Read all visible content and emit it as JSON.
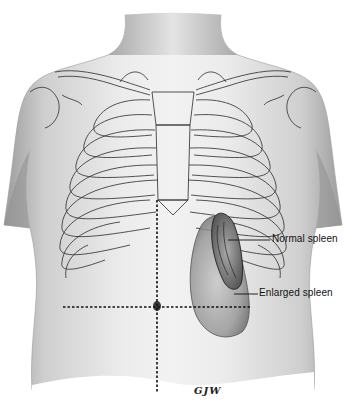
{
  "figure": {
    "labels": {
      "normal_spleen": "Normal spleen",
      "enlarged_spleen": "Enlarged spleen"
    },
    "signature": "GJW",
    "colors": {
      "background": "#ffffff",
      "skin_light": "#e6e6e6",
      "skin_mid": "#bdbdbd",
      "skin_dark": "#8a8a8a",
      "outline": "#2a2a2a",
      "dotted_line": "#111111"
    }
  }
}
